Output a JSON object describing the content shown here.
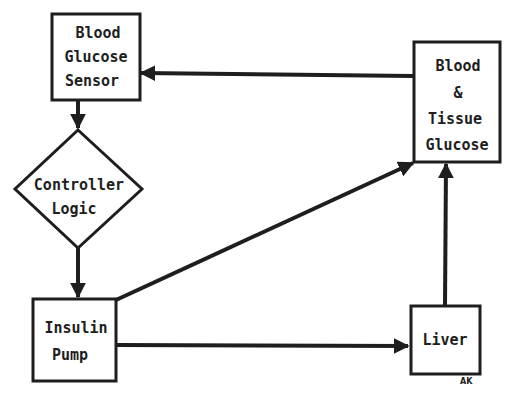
{
  "diagram": {
    "type": "feedback-loop block diagram",
    "nodes": [
      {
        "id": "sensor",
        "shape": "rectangle",
        "lines": [
          "Blood",
          "Glucose",
          "Sensor"
        ]
      },
      {
        "id": "controller",
        "shape": "diamond",
        "lines": [
          "Controller",
          "Logic"
        ]
      },
      {
        "id": "pump",
        "shape": "rectangle",
        "lines": [
          "Insulin",
          "Pump"
        ]
      },
      {
        "id": "liver",
        "shape": "rectangle",
        "lines": [
          "Liver"
        ]
      },
      {
        "id": "tissue",
        "shape": "rectangle",
        "lines": [
          "Blood",
          "&",
          "Tissue",
          "Glucose"
        ]
      }
    ],
    "edges": [
      {
        "from": "sensor",
        "to": "controller"
      },
      {
        "from": "controller",
        "to": "pump"
      },
      {
        "from": "pump",
        "to": "liver"
      },
      {
        "from": "pump",
        "to": "tissue"
      },
      {
        "from": "liver",
        "to": "tissue"
      },
      {
        "from": "tissue",
        "to": "sensor"
      }
    ],
    "annotation": "AK",
    "colors": {
      "ink": "#1e1e1e",
      "background": "#ffffff"
    }
  }
}
